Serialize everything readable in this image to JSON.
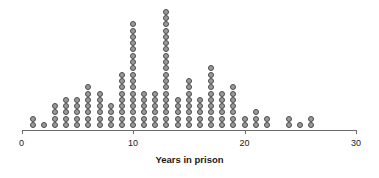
{
  "chart_data": {
    "type": "bar",
    "subtype": "dotplot",
    "title": "",
    "subtitle": "",
    "xlabel": "Years in prison",
    "ylabel": "",
    "xlim": [
      0,
      30
    ],
    "xticks": [
      0,
      10,
      20,
      30
    ],
    "xtick_labels": [
      "0",
      "10",
      "20",
      "30"
    ],
    "grid": false,
    "legend": null,
    "annotations": [],
    "categories": [
      1,
      2,
      3,
      4,
      5,
      6,
      7,
      8,
      9,
      10,
      11,
      12,
      13,
      14,
      15,
      16,
      17,
      18,
      19,
      20,
      21,
      22,
      24,
      25,
      26
    ],
    "values": [
      2,
      1,
      4,
      5,
      5,
      7,
      6,
      4,
      9,
      17,
      6,
      6,
      19,
      5,
      8,
      5,
      10,
      6,
      7,
      2,
      3,
      2,
      2,
      1,
      2
    ],
    "dot_color": "#9a9a9a",
    "dot_edge_color": "#4a4a4a",
    "axis_color": "#6b6b6b"
  },
  "axis": {
    "title": "Years in prison",
    "ticks": [
      {
        "value": 0,
        "label": "0"
      },
      {
        "value": 10,
        "label": "10"
      },
      {
        "value": 20,
        "label": "20"
      },
      {
        "value": 30,
        "label": "30"
      }
    ]
  }
}
